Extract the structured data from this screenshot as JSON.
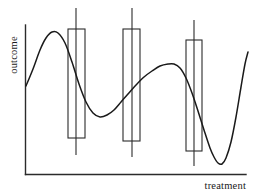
{
  "figure": {
    "title": "",
    "axes": {
      "x_label": "treatment",
      "y_label": "outcome"
    }
  },
  "chart_data": {
    "type": "line",
    "title": "",
    "xlabel": "treatment",
    "ylabel": "outcome",
    "grid": false,
    "legend": null,
    "axis_ticks": {
      "x": [],
      "y": []
    },
    "xlim": [
      0,
      100
    ],
    "ylim": [
      0,
      100
    ],
    "series": [
      {
        "name": "dose-response curve",
        "type": "line",
        "comment": "Smooth wiggly outcome curve plotted in figure pixel space (x right, y down)",
        "points": [
          [
            26,
            86
          ],
          [
            33,
            69
          ],
          [
            40,
            50
          ],
          [
            46,
            38
          ],
          [
            52,
            32
          ],
          [
            58,
            33
          ],
          [
            65,
            43
          ],
          [
            72,
            62
          ],
          [
            79,
            84
          ],
          [
            86,
            102
          ],
          [
            93,
            113
          ],
          [
            100,
            117
          ],
          [
            107,
            115
          ],
          [
            114,
            110
          ],
          [
            121,
            102
          ],
          [
            128,
            94
          ],
          [
            136,
            85
          ],
          [
            144,
            77
          ],
          [
            152,
            71
          ],
          [
            160,
            66
          ],
          [
            168,
            64
          ],
          [
            174,
            64
          ],
          [
            180,
            68
          ],
          [
            186,
            78
          ],
          [
            192,
            93
          ],
          [
            198,
            111
          ],
          [
            204,
            130
          ],
          [
            210,
            148
          ],
          [
            214,
            157
          ],
          [
            218,
            163
          ],
          [
            222,
            164
          ],
          [
            226,
            158
          ],
          [
            231,
            142
          ],
          [
            236,
            117
          ],
          [
            241,
            87
          ],
          [
            245,
            64
          ],
          [
            248,
            52
          ]
        ]
      },
      {
        "name": "box-whisker overlays",
        "type": "box",
        "boxes": [
          {
            "label": "box-1",
            "center_x": 76,
            "box_left": 68,
            "box_right": 85,
            "box_top": 29,
            "box_bottom": 138,
            "whisker_top": 8,
            "whisker_bottom": 155
          },
          {
            "label": "box-2",
            "center_x": 132,
            "box_left": 123,
            "box_right": 140,
            "box_top": 29,
            "box_bottom": 141,
            "whisker_top": 8,
            "whisker_bottom": 157
          },
          {
            "label": "box-3",
            "center_x": 194,
            "box_left": 186,
            "box_right": 202,
            "box_top": 40,
            "box_bottom": 151,
            "whisker_top": 20,
            "whisker_bottom": 166
          }
        ]
      }
    ],
    "axis_geometry": {
      "y_axis_x": 25.5,
      "y_axis_top": 25,
      "y_axis_bottom": 174.5,
      "x_axis_y": 174.5,
      "x_axis_left": 25.5,
      "x_axis_right": 246
    },
    "colors": {
      "curve": "#1a1a1a",
      "axis": "#2b2b2b",
      "box": "#2b2b2b",
      "background": "#ffffff"
    }
  }
}
